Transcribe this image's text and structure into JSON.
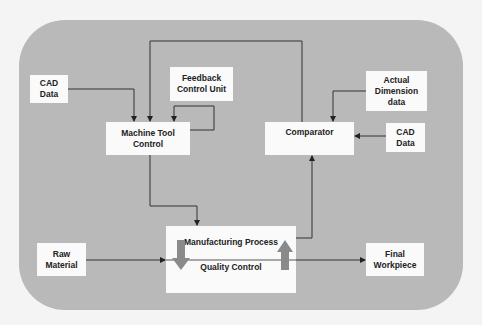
{
  "diagram": {
    "background_color": "#b9b9b9",
    "box_color": "#fafafa",
    "block_arrow_color": "#8a8a8a",
    "nodes": {
      "cad_data_left": {
        "line1": "CAD",
        "line2": "Data"
      },
      "feedback_control_unit": {
        "line1": "Feedback",
        "line2": "Control Unit"
      },
      "machine_tool_control": {
        "line1": "Machine Tool",
        "line2": "Control"
      },
      "actual_dimension_data": {
        "line1": "Actual",
        "line2": "Dimension",
        "line3": "data"
      },
      "comparator": {
        "line1": "Comparator"
      },
      "cad_data_right": {
        "line1": "CAD",
        "line2": "Data"
      },
      "raw_material": {
        "line1": "Raw",
        "line2": "Material"
      },
      "manufacturing_process": {
        "top_label": "Manufacturing Process",
        "bottom_label": "Quality Control"
      },
      "final_workpiece": {
        "line1": "Final",
        "line2": "Workpiece"
      }
    },
    "edges": [
      {
        "from": "CAD Data",
        "to": "Machine Tool Control"
      },
      {
        "from": "Comparator",
        "to": "Machine Tool Control"
      },
      {
        "from": "Feedback Control Unit",
        "to": "Machine Tool Control"
      },
      {
        "from": "Machine Tool Control",
        "to": "Feedback Control Unit"
      },
      {
        "from": "Actual Dimension data",
        "to": "Comparator"
      },
      {
        "from": "CAD Data",
        "to": "Comparator"
      },
      {
        "from": "Machine Tool Control",
        "to": "Manufacturing Process"
      },
      {
        "from": "Manufacturing Process",
        "to": "Comparator"
      },
      {
        "from": "Raw Material",
        "to": "Manufacturing Process"
      },
      {
        "from": "Manufacturing Process",
        "to": "Final Workpiece"
      }
    ]
  }
}
